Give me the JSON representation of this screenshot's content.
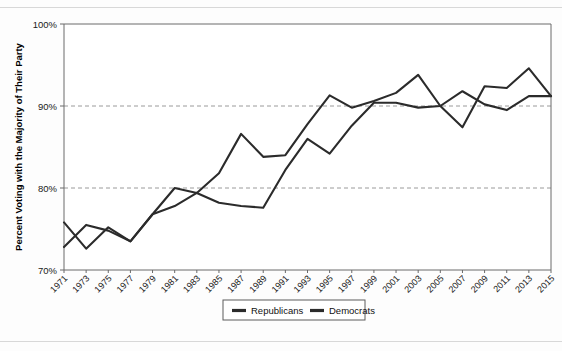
{
  "chart_data": {
    "type": "line",
    "title": "",
    "xlabel": "",
    "ylabel": "Percent Voting with the Majority of Their Party",
    "ylim": [
      70,
      100
    ],
    "yticks": [
      70,
      80,
      90,
      100
    ],
    "ytick_labels": [
      "70%",
      "80%",
      "90%",
      "100%"
    ],
    "grid": "horizontal-dashed-at-80-and-90",
    "legend_position": "bottom-center",
    "x": [
      1971,
      1973,
      1975,
      1977,
      1979,
      1981,
      1983,
      1985,
      1987,
      1989,
      1991,
      1993,
      1995,
      1997,
      1999,
      2001,
      2003,
      2005,
      2007,
      2009,
      2011,
      2013,
      2015
    ],
    "xtick_labels": [
      "1971",
      "1973",
      "1975",
      "1977",
      "1979",
      "1981",
      "1983",
      "1985",
      "1987",
      "1989",
      "1991",
      "1993",
      "1995",
      "1997",
      "1999",
      "2001",
      "2003",
      "2005",
      "2007",
      "2009",
      "2011",
      "2013",
      "2015"
    ],
    "series": [
      {
        "name": "Republicans",
        "color": "#2b2b2b",
        "values": [
          75.8,
          72.6,
          75.2,
          73.5,
          76.8,
          80.0,
          79.4,
          81.8,
          86.6,
          83.8,
          84.0,
          87.8,
          91.3,
          89.8,
          90.6,
          91.6,
          93.8,
          90.0,
          87.4,
          92.4,
          92.2,
          94.6,
          91.2
        ]
      },
      {
        "name": "Democrats",
        "color": "#2b2b2b",
        "values": [
          72.8,
          75.5,
          74.8,
          73.5,
          76.8,
          77.8,
          79.4,
          78.2,
          77.8,
          77.6,
          82.2,
          86.0,
          84.2,
          87.6,
          90.4,
          90.4,
          89.8,
          90.0,
          91.8,
          90.2,
          89.5,
          91.2,
          91.2
        ]
      }
    ]
  },
  "legend": {
    "entries": [
      {
        "label": "Republicans"
      },
      {
        "label": "Democrats"
      }
    ]
  },
  "axes": {
    "y_title": "Percent Voting with the Majority of Their Party"
  }
}
